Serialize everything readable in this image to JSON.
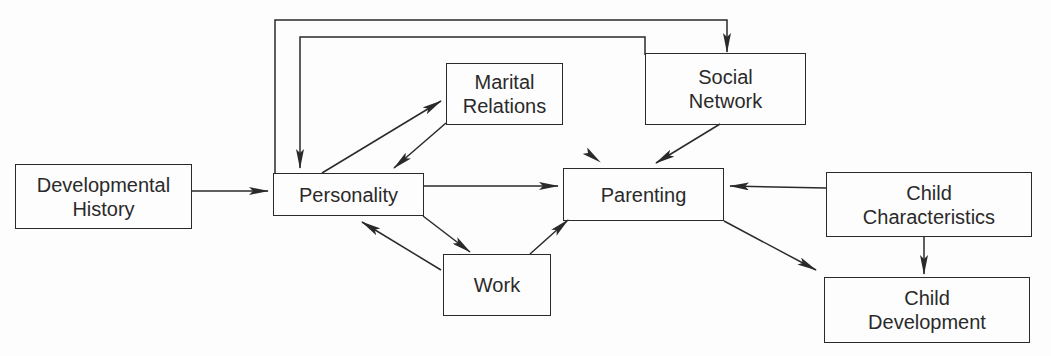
{
  "diagram": {
    "type": "flow-model",
    "nodes": [
      {
        "id": "dev_history",
        "lines": [
          "Developmental",
          "History"
        ],
        "x": 15,
        "y": 164,
        "w": 177,
        "h": 65
      },
      {
        "id": "personality",
        "lines": [
          "Personality"
        ],
        "x": 273,
        "y": 173,
        "w": 151,
        "h": 43
      },
      {
        "id": "marital",
        "lines": [
          "Marital",
          "Relations"
        ],
        "x": 446,
        "y": 63,
        "w": 117,
        "h": 62
      },
      {
        "id": "social",
        "lines": [
          "Social",
          "Network"
        ],
        "x": 645,
        "y": 53,
        "w": 161,
        "h": 72
      },
      {
        "id": "parenting",
        "lines": [
          "Parenting"
        ],
        "x": 563,
        "y": 168,
        "w": 161,
        "h": 53
      },
      {
        "id": "work",
        "lines": [
          "Work"
        ],
        "x": 443,
        "y": 254,
        "w": 108,
        "h": 62
      },
      {
        "id": "child_char",
        "lines": [
          "Child",
          "Characteristics"
        ],
        "x": 826,
        "y": 172,
        "w": 206,
        "h": 65
      },
      {
        "id": "child_dev",
        "lines": [
          "Child",
          "Development"
        ],
        "x": 824,
        "y": 277,
        "w": 206,
        "h": 66
      }
    ],
    "edges": [
      {
        "from": "dev_history",
        "to": "personality",
        "points": [
          [
            192,
            191
          ],
          [
            268,
            191
          ]
        ]
      },
      {
        "from": "personality",
        "to": "social",
        "points": [
          [
            275,
            173
          ],
          [
            275,
            20
          ],
          [
            727,
            20
          ],
          [
            727,
            52
          ]
        ]
      },
      {
        "from": "social",
        "to": "personality",
        "points": [
          [
            645,
            55
          ],
          [
            645,
            37
          ],
          [
            300,
            37
          ],
          [
            300,
            168
          ]
        ]
      },
      {
        "from": "personality",
        "to": "marital",
        "points": [
          [
            322,
            173
          ],
          [
            441,
            101
          ]
        ]
      },
      {
        "from": "marital",
        "to": "personality",
        "points": [
          [
            446,
            123
          ],
          [
            394,
            168
          ]
        ]
      },
      {
        "from": "personality",
        "to": "parenting",
        "points": [
          [
            424,
            186
          ],
          [
            558,
            186
          ]
        ]
      },
      {
        "from": "personality",
        "to": "work",
        "points": [
          [
            423,
            216
          ],
          [
            470,
            252
          ]
        ]
      },
      {
        "from": "work",
        "to": "personality",
        "points": [
          [
            441,
            270
          ],
          [
            362,
            222
          ]
        ]
      },
      {
        "from": "work",
        "to": "parenting",
        "points": [
          [
            530,
            254
          ],
          [
            568,
            220
          ]
        ]
      },
      {
        "from": "social",
        "to": "parenting",
        "points": [
          [
            720,
            124
          ],
          [
            656,
            163
          ]
        ]
      },
      {
        "from": "child_char",
        "to": "parenting",
        "points": [
          [
            826,
            188
          ],
          [
            730,
            186
          ]
        ]
      },
      {
        "from": "parenting",
        "to": "child_dev",
        "points": [
          [
            724,
            221
          ],
          [
            816,
            270
          ]
        ]
      },
      {
        "from": "child_char",
        "to": "child_dev",
        "points": [
          [
            924,
            237
          ],
          [
            924,
            274
          ]
        ]
      }
    ],
    "stray_arrowheads": [
      {
        "points": [
          [
            584,
            150
          ],
          [
            600,
            162
          ]
        ]
      }
    ],
    "colors": {
      "stroke": "#2a2a2a",
      "background": "#fdfdfd"
    }
  }
}
